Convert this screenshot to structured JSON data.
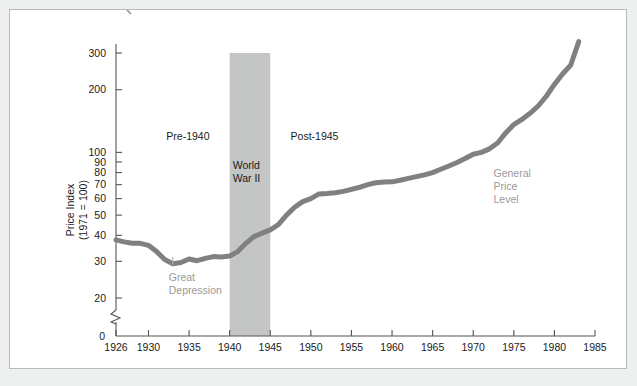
{
  "figure": {
    "background_color": "#eef0ef",
    "panel_color": "#ffffff",
    "border_color": "#b8bcbb"
  },
  "chart_data": {
    "type": "line",
    "title": "",
    "subtitle": "",
    "xlabel": "",
    "ylabel": "Price Index\n(1971 = 100)",
    "ylabel_lines": [
      "Price Index",
      "(1971 = 100)"
    ],
    "yscale": "log",
    "ylim": [
      18,
      360
    ],
    "xlim": [
      1926,
      1985
    ],
    "grid": false,
    "legend": "none",
    "axis_break": true,
    "y_zero_label": "0",
    "ytick_labels": [
      "20",
      "30",
      "40",
      "50",
      "60",
      "70",
      "80",
      "90",
      "100",
      "200",
      "300"
    ],
    "yticks": [
      20,
      30,
      40,
      50,
      60,
      70,
      80,
      90,
      100,
      200,
      300
    ],
    "xtick_labels": [
      "1926",
      "1930",
      "1935",
      "1940",
      "1945",
      "1950",
      "1955",
      "1960",
      "1965",
      "1970",
      "1975",
      "1980",
      "1985"
    ],
    "xticks": [
      1926,
      1930,
      1935,
      1940,
      1945,
      1950,
      1955,
      1960,
      1965,
      1970,
      1975,
      1980,
      1985
    ],
    "series": [
      {
        "name": "General Price Level",
        "color": "#7f8180",
        "line_width": 5,
        "x": [
          1926,
          1927,
          1928,
          1929,
          1930,
          1931,
          1932,
          1933,
          1934,
          1935,
          1936,
          1937,
          1938,
          1939,
          1940,
          1941,
          1942,
          1943,
          1944,
          1945,
          1946,
          1947,
          1948,
          1949,
          1950,
          1951,
          1952,
          1953,
          1954,
          1955,
          1956,
          1957,
          1958,
          1959,
          1960,
          1961,
          1962,
          1963,
          1964,
          1965,
          1966,
          1967,
          1968,
          1969,
          1970,
          1971,
          1972,
          1973,
          1974,
          1975,
          1976,
          1977,
          1978,
          1979,
          1980,
          1981,
          1982,
          1983
        ],
        "y": [
          38.0,
          37.2,
          36.6,
          36.6,
          35.8,
          33.4,
          30.6,
          29.2,
          29.6,
          30.8,
          30.2,
          31.0,
          31.6,
          31.5,
          31.8,
          33.4,
          36.6,
          39.4,
          41.0,
          42.5,
          45.0,
          50.0,
          54.5,
          58.0,
          60.0,
          63.2,
          63.5,
          64.0,
          65.0,
          66.5,
          68.0,
          70.0,
          71.5,
          72.0,
          72.2,
          73.5,
          75.0,
          76.5,
          78.0,
          80.0,
          83.0,
          86.0,
          89.5,
          93.5,
          98.0,
          100.0,
          104.0,
          111.0,
          124.0,
          136.0,
          144.0,
          154.0,
          167.0,
          186.0,
          212.0,
          238.0,
          262.0,
          340.0
        ]
      }
    ],
    "bands": [
      {
        "name": "World War II",
        "label_lines": [
          "World",
          "War II"
        ],
        "x_start": 1940,
        "x_end": 1945,
        "y_top": 300,
        "color": "#c4c6c5"
      }
    ],
    "annotations": [
      {
        "name": "pre-1940",
        "text": "Pre-1940",
        "x": 1932.2,
        "y": 115,
        "color": "#1a1a1a"
      },
      {
        "name": "post-1945",
        "text": "Post-1945",
        "x": 1947.5,
        "y": 115,
        "color": "#1a1a1a"
      },
      {
        "name": "great-depression",
        "text_lines": [
          "Great",
          "Depression"
        ],
        "x": 1932.5,
        "y": 24.2,
        "color": "#9a9a9a",
        "leader_line": true
      },
      {
        "name": "series-callout",
        "text_lines": [
          "General",
          "Price",
          "Level"
        ],
        "x": 1972.5,
        "y": 76,
        "color": "#9a9a9a"
      }
    ]
  }
}
